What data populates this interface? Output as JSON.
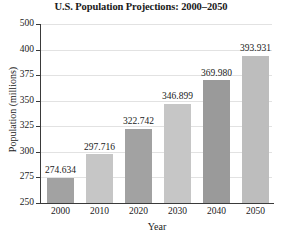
{
  "chart_data": {
    "type": "bar",
    "title": "U.S. Population Projections: 2000–2050",
    "xlabel": "Year",
    "ylabel": "Population (millions)",
    "categories": [
      "2000",
      "2010",
      "2020",
      "2030",
      "2040",
      "2050"
    ],
    "values": [
      274.634,
      297.716,
      322.742,
      346.899,
      369.98,
      393.931
    ],
    "value_labels": [
      "274.634",
      "297.716",
      "322.742",
      "346.899",
      "369.980",
      "393.931"
    ],
    "ytick_labels": [
      "250",
      "275",
      "300",
      "325",
      "350",
      "375",
      "400",
      "500"
    ],
    "ytick_values": [
      250,
      275,
      300,
      325,
      350,
      375,
      400,
      500
    ],
    "ylim": [
      250,
      500
    ],
    "axis_note": "irregular y-axis: ticks evenly spaced so 400-500 interval is compressed",
    "grid": true,
    "legend": "none",
    "bar_colors": [
      "#a2a2a2",
      "#c6c6c6",
      "#a2a2a2",
      "#c6c6c6",
      "#9a9a9a",
      "#bdbdbd"
    ],
    "series": [
      {
        "name": "U.S. Population",
        "values": [
          274.634,
          297.716,
          322.742,
          346.899,
          369.98,
          393.931
        ]
      }
    ],
    "points": [
      {
        "year": "2000",
        "population": 274.634
      },
      {
        "year": "2010",
        "population": 297.716
      },
      {
        "year": "2020",
        "population": 322.742
      },
      {
        "year": "2030",
        "population": 346.899
      },
      {
        "year": "2040",
        "population": 369.98
      },
      {
        "year": "2050",
        "population": 393.931
      }
    ]
  },
  "colors": {
    "background": "#ffffff",
    "axis": "#3a3a3a",
    "grid": "#e2e2e2",
    "text": "#1a1a1a"
  }
}
